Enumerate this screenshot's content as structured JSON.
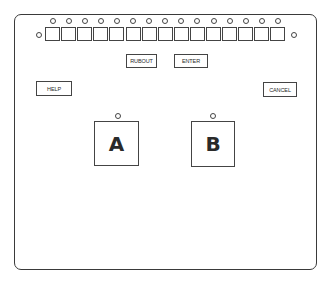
{
  "panel": {
    "key_count": 15,
    "buttons": {
      "rubout": "RUBOUT",
      "enter": "ENTER",
      "help": "HELP",
      "cancel": "CANCEL"
    },
    "choices": {
      "a": "A",
      "b": "B"
    }
  },
  "colors": {
    "line": "#444444",
    "background": "#ffffff"
  }
}
